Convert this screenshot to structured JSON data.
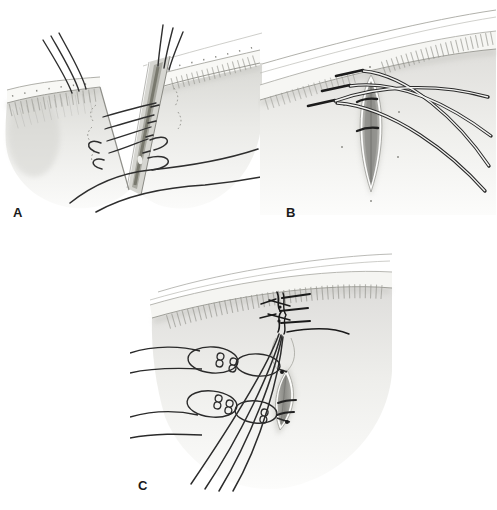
{
  "figure": {
    "type": "medical-surgical-illustration",
    "panels": [
      {
        "id": "panel-a",
        "label": "A"
      },
      {
        "id": "panel-b",
        "label": "B"
      },
      {
        "id": "panel-c",
        "label": "C"
      }
    ]
  },
  "palette": {
    "background": "#ffffff",
    "ink": "#2d2d2d",
    "label_color": "#1a1a1a",
    "skin_light": "#f6f6f4",
    "skin_mid": "#dedddb",
    "skin_shadow": "#c9c9c4",
    "margin_band": "#f6f6f3",
    "wound_gray": "#8e8e89",
    "tarsus_dark": "#79796e"
  }
}
